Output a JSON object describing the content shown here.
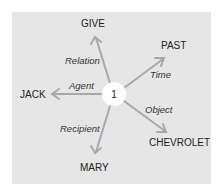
{
  "diagram": {
    "center": {
      "label": "1"
    },
    "nodes": {
      "give": "GIVE",
      "past": "PAST",
      "jack": "JACK",
      "chevrolet": "CHEVROLET",
      "mary": "MARY"
    },
    "edges": {
      "relation": "Relation",
      "time": "Time",
      "agent": "Agent",
      "object": "Object",
      "recipient": "Recipient"
    },
    "colors": {
      "panel": "#e6e6e6",
      "arrow": "#a8a8a8",
      "center_fill": "#ffffff"
    }
  }
}
